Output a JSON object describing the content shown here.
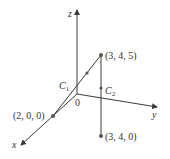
{
  "diagram": {
    "type": "3d-coordinate-axes",
    "colors": {
      "line": "#3a3a3a",
      "point": "#555555",
      "text": "#333333",
      "background": "#ffffff"
    },
    "axes": {
      "x_label": "x",
      "y_label": "y",
      "z_label": "z",
      "origin_label": "0"
    },
    "points": [
      {
        "label": "(3, 4, 5)",
        "coords": [
          3,
          4,
          5
        ]
      },
      {
        "label": "(2, 0, 0)",
        "coords": [
          2,
          0,
          0
        ]
      },
      {
        "label": "(3, 4, 0)",
        "coords": [
          3,
          4,
          0
        ]
      }
    ],
    "curves": [
      {
        "name": "C",
        "subscript": "1",
        "from": "(2, 0, 0)",
        "to": "(3, 4, 5)"
      },
      {
        "name": "C",
        "subscript": "2",
        "from": "(3, 4, 5)",
        "to": "(3, 4, 0)"
      }
    ]
  }
}
